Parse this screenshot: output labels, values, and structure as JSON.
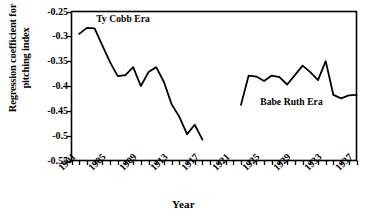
{
  "chart_data": {
    "type": "line",
    "title": "",
    "xlabel": "Year",
    "ylabel": "Regression coefficient for pitching index",
    "ylabel_line1": "Regression coefficient for",
    "ylabel_line2": "pitching index",
    "xlim": [
      1901,
      1938
    ],
    "ylim": [
      -0.55,
      -0.25
    ],
    "grid": false,
    "legend": "none (inline annotations)",
    "y_ticks": [
      -0.25,
      -0.3,
      -0.35,
      -0.4,
      -0.45,
      -0.5,
      -0.55
    ],
    "y_tick_labels": [
      "-0.25",
      "-0.3",
      "-0.35",
      "-0.4",
      "-0.45",
      "-0.5",
      "-0.55"
    ],
    "x_ticks": [
      1901,
      1905,
      1909,
      1913,
      1917,
      1921,
      1925,
      1929,
      1933,
      1937
    ],
    "x_tick_labels": [
      "1901",
      "1905",
      "1909",
      "1913",
      "1917",
      "1921",
      "1925",
      "1929",
      "1933",
      "1937"
    ],
    "x_minor_tick_interval": 1,
    "line_color": "#000000",
    "annotations": [
      {
        "text": "Ty Cobb Era",
        "x": 1904.2,
        "y": -0.2665
      },
      {
        "text": "Babe Ruth Era",
        "x": 1925.5,
        "y": -0.4345
      }
    ],
    "series": [
      {
        "name": "Ty Cobb Era",
        "x": [
          1902,
          1903,
          1904,
          1905,
          1906,
          1907,
          1908,
          1909,
          1910,
          1911,
          1912,
          1913,
          1914,
          1915,
          1916,
          1917,
          1918
        ],
        "values": [
          -0.295,
          -0.283,
          -0.284,
          -0.318,
          -0.352,
          -0.38,
          -0.378,
          -0.362,
          -0.4,
          -0.372,
          -0.362,
          -0.392,
          -0.437,
          -0.462,
          -0.497,
          -0.478,
          -0.508
        ]
      },
      {
        "name": "Babe Ruth Era",
        "x": [
          1923,
          1924,
          1925,
          1926,
          1927,
          1928,
          1929,
          1930,
          1931,
          1932,
          1933,
          1934,
          1935,
          1936,
          1937,
          1938
        ],
        "values": [
          -0.438,
          -0.379,
          -0.381,
          -0.39,
          -0.379,
          -0.382,
          -0.397,
          -0.378,
          -0.359,
          -0.372,
          -0.388,
          -0.35,
          -0.418,
          -0.425,
          -0.419,
          -0.418
        ]
      }
    ]
  }
}
